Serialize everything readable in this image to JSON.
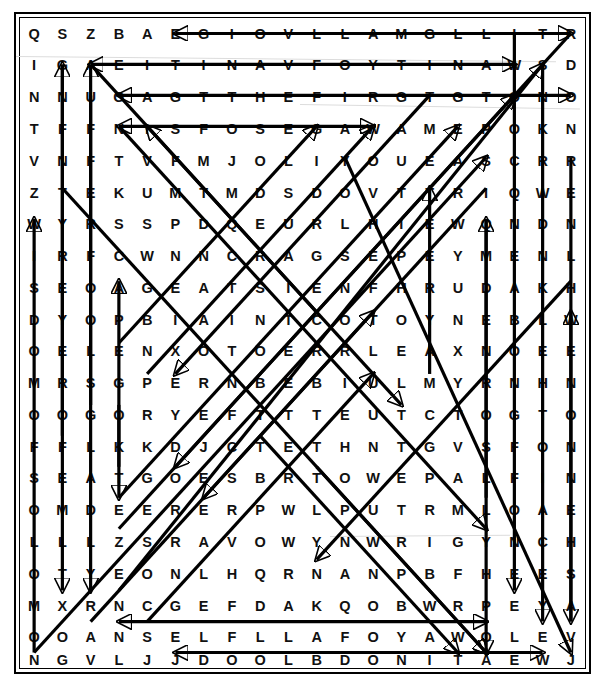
{
  "puzzle": {
    "type": "word-search",
    "rows": 20,
    "cols": 20,
    "ink_color": "#000000",
    "paper_color": "#ffffff",
    "grid": [
      [
        "Q",
        "S",
        "Z",
        "B",
        "A",
        "E",
        "G",
        "I",
        "O",
        "V",
        "L",
        "L",
        "A",
        "M",
        "G",
        "L",
        "L",
        "I",
        "T",
        "R"
      ],
      [
        "I",
        "G",
        "A",
        "E",
        "I",
        "T",
        "I",
        "N",
        "A",
        "V",
        "F",
        "O",
        "Y",
        "T",
        "I",
        "N",
        "A",
        "W",
        "S",
        "D"
      ],
      [
        "N",
        "N",
        "U",
        "G",
        "A",
        "G",
        "T",
        "T",
        "H",
        "E",
        "F",
        "I",
        "R",
        "G",
        "T",
        "G",
        "T",
        "O",
        "N",
        "O"
      ],
      [
        "T",
        "F",
        "F",
        "N",
        "I",
        "S",
        "F",
        "O",
        "S",
        "E",
        "G",
        "A",
        "W",
        "A",
        "M",
        "E",
        "P",
        "O",
        "K",
        "N",
        "C"
      ],
      [
        "V",
        "N",
        "F",
        "T",
        "V",
        "F",
        "M",
        "J",
        "O",
        "L",
        "I",
        "Y",
        "O",
        "U",
        "E",
        "A",
        "S",
        "C",
        "R",
        "R"
      ],
      [
        "Z",
        "T",
        "E",
        "K",
        "U",
        "M",
        "T",
        "M",
        "D",
        "S",
        "D",
        "O",
        "V",
        "T",
        "T",
        "R",
        "I",
        "Q",
        "W",
        "E"
      ],
      [
        "W",
        "Y",
        "R",
        "S",
        "S",
        "P",
        "D",
        "Q",
        "E",
        "U",
        "R",
        "L",
        "H",
        "I",
        "E",
        "W",
        "Q",
        "N",
        "D",
        "N"
      ],
      [
        "I",
        "R",
        "F",
        "C",
        "W",
        "N",
        "N",
        "C",
        "R",
        "A",
        "G",
        "S",
        "E",
        "P",
        "E",
        "Y",
        "M",
        "E",
        "N",
        "L"
      ],
      [
        "S",
        "E",
        "O",
        "A",
        "G",
        "E",
        "A",
        "T",
        "S",
        "I",
        "E",
        "N",
        "F",
        "H",
        "R",
        "U",
        "D",
        "A",
        "K",
        "H"
      ],
      [
        "D",
        "Y",
        "O",
        "P",
        "B",
        "I",
        "A",
        "I",
        "N",
        "T",
        "C",
        "O",
        "T",
        "O",
        "Y",
        "N",
        "E",
        "B",
        "L",
        "W"
      ],
      [
        "O",
        "E",
        "L",
        "E",
        "N",
        "X",
        "O",
        "T",
        "O",
        "E",
        "R",
        "R",
        "L",
        "E",
        "A",
        "X",
        "N",
        "O",
        "E",
        "E"
      ],
      [
        "M",
        "R",
        "S",
        "G",
        "P",
        "E",
        "R",
        "N",
        "B",
        "E",
        "B",
        "I",
        "U",
        "L",
        "M",
        "Y",
        "R",
        "N",
        "H",
        "N"
      ],
      [
        "O",
        "O",
        "G",
        "O",
        "R",
        "Y",
        "E",
        "F",
        "T",
        "T",
        "T",
        "E",
        "U",
        "T",
        "C",
        "T",
        "O",
        "G",
        "T",
        "O"
      ],
      [
        "F",
        "F",
        "L",
        "K",
        "K",
        "D",
        "J",
        "C",
        "T",
        "E",
        "T",
        "H",
        "N",
        "T",
        "G",
        "V",
        "S",
        "F",
        "O",
        "N"
      ],
      [
        "S",
        "E",
        "A",
        "T",
        "G",
        "O",
        "E",
        "S",
        "B",
        "R",
        "T",
        "O",
        "W",
        "E",
        "P",
        "A",
        "L",
        "F",
        "I",
        "N"
      ],
      [
        "O",
        "M",
        "D",
        "E",
        "E",
        "R",
        "E",
        "R",
        "P",
        "W",
        "L",
        "P",
        "U",
        "T",
        "R",
        "M",
        "L",
        "O",
        "A",
        "E"
      ],
      [
        "L",
        "L",
        "L",
        "Z",
        "S",
        "R",
        "A",
        "V",
        "O",
        "W",
        "Y",
        "N",
        "W",
        "R",
        "I",
        "G",
        "Y",
        "N",
        "C",
        "H"
      ],
      [
        "O",
        "T",
        "Y",
        "E",
        "O",
        "N",
        "L",
        "H",
        "Q",
        "R",
        "N",
        "A",
        "N",
        "P",
        "B",
        "F",
        "H",
        "E",
        "E",
        "S"
      ],
      [
        "M",
        "X",
        "R",
        "N",
        "C",
        "G",
        "E",
        "F",
        "D",
        "A",
        "K",
        "Q",
        "O",
        "B",
        "W",
        "R",
        "P",
        "E",
        "Y",
        "A"
      ],
      [
        "O",
        "O",
        "A",
        "N",
        "S",
        "E",
        "L",
        "F",
        "L",
        "L",
        "A",
        "F",
        "O",
        "Y",
        "A",
        "W",
        "O",
        "L",
        "E",
        "V"
      ],
      [
        "N",
        "G",
        "V",
        "L",
        "J",
        "J",
        "D",
        "O",
        "O",
        "L",
        "B",
        "D",
        "O",
        "N",
        "I",
        "T",
        "A",
        "E",
        "W",
        "J"
      ]
    ]
  },
  "solution_lines": [
    {
      "name": "row-0-horizontal-left-arrow",
      "from_cell": [
        0,
        19
      ],
      "to_cell": [
        0,
        5
      ],
      "arrow": "both"
    },
    {
      "name": "row-1-horizontal-right-arrow",
      "from_cell": [
        1,
        2
      ],
      "to_cell": [
        1,
        17
      ],
      "arrow": "both"
    },
    {
      "name": "row-2-horizontal-right-arrow",
      "from_cell": [
        2,
        3
      ],
      "to_cell": [
        2,
        19
      ],
      "arrow": "both"
    },
    {
      "name": "row-3-horizontal-right-arrow",
      "from_cell": [
        3,
        3
      ],
      "to_cell": [
        3,
        12
      ],
      "arrow": "both"
    },
    {
      "name": "row-19-horizontal-right-arrow",
      "from_cell": [
        19,
        3
      ],
      "to_cell": [
        19,
        16
      ],
      "arrow": "both"
    },
    {
      "name": "row-20-horizontal-right-arrow",
      "from_cell": [
        20,
        5
      ],
      "to_cell": [
        20,
        18
      ],
      "arrow": "both"
    },
    {
      "name": "col-1-vertical-up",
      "from_cell": [
        13,
        1
      ],
      "to_cell": [
        1,
        1
      ],
      "arrow": "end"
    },
    {
      "name": "col-2-vertical-up",
      "from_cell": [
        12,
        2
      ],
      "to_cell": [
        1,
        2
      ],
      "arrow": "end"
    },
    {
      "name": "col-1-vertical-down",
      "from_cell": [
        1,
        1
      ],
      "to_cell": [
        18,
        1
      ],
      "arrow": "end"
    },
    {
      "name": "col-2-vertical-down",
      "from_cell": [
        2,
        2
      ],
      "to_cell": [
        18,
        2
      ],
      "arrow": "end"
    },
    {
      "name": "col-0-vertical-up",
      "from_cell": [
        20,
        0
      ],
      "to_cell": [
        6,
        0
      ],
      "arrow": "end"
    },
    {
      "name": "col-3-vertical-up",
      "from_cell": [
        14,
        3
      ],
      "to_cell": [
        8,
        3
      ],
      "arrow": "end"
    },
    {
      "name": "col-3-vertical-down",
      "from_cell": [
        12,
        3
      ],
      "to_cell": [
        15,
        3
      ],
      "arrow": "end"
    },
    {
      "name": "col-14-vertical-up",
      "from_cell": [
        11,
        14
      ],
      "to_cell": [
        5,
        14
      ],
      "arrow": "end"
    },
    {
      "name": "col-16-vertical-up",
      "from_cell": [
        15,
        16
      ],
      "to_cell": [
        6,
        16
      ],
      "arrow": "end"
    },
    {
      "name": "col-16-vertical-down",
      "from_cell": [
        6,
        16
      ],
      "to_cell": [
        20,
        16
      ],
      "arrow": "end"
    },
    {
      "name": "col-17-vertical-down",
      "from_cell": [
        0,
        17
      ],
      "to_cell": [
        18,
        17
      ],
      "arrow": "end"
    },
    {
      "name": "col-18-vertical-down",
      "from_cell": [
        1,
        18
      ],
      "to_cell": [
        19,
        18
      ],
      "arrow": "end"
    },
    {
      "name": "col-19-vertical-down",
      "from_cell": [
        4,
        19
      ],
      "to_cell": [
        19,
        19
      ],
      "arrow": "end"
    },
    {
      "name": "col-19-vertical-up",
      "from_cell": [
        19,
        19
      ],
      "to_cell": [
        9,
        19
      ],
      "arrow": "end"
    },
    {
      "name": "diag-down-right-1",
      "from_cell": [
        1,
        2
      ],
      "to_cell": [
        12,
        13
      ],
      "arrow": "end"
    },
    {
      "name": "diag-down-right-2",
      "from_cell": [
        3,
        3
      ],
      "to_cell": [
        16,
        16
      ],
      "arrow": "end"
    },
    {
      "name": "diag-down-right-3",
      "from_cell": [
        5,
        1
      ],
      "to_cell": [
        20,
        16
      ],
      "arrow": "end"
    },
    {
      "name": "diag-up-right-1",
      "from_cell": [
        10,
        3
      ],
      "to_cell": [
        3,
        10
      ],
      "arrow": "end"
    },
    {
      "name": "diag-up-right-2",
      "from_cell": [
        11,
        4
      ],
      "to_cell": [
        3,
        12
      ],
      "arrow": "end"
    },
    {
      "name": "diag-up-right-3",
      "from_cell": [
        15,
        3
      ],
      "to_cell": [
        3,
        15
      ],
      "arrow": "end"
    },
    {
      "name": "diag-up-right-4",
      "from_cell": [
        16,
        3
      ],
      "to_cell": [
        2,
        17
      ],
      "arrow": "end"
    },
    {
      "name": "diag-up-right-5",
      "from_cell": [
        18,
        3
      ],
      "to_cell": [
        1,
        18
      ],
      "arrow": "end"
    },
    {
      "name": "diag-up-right-6",
      "from_cell": [
        19,
        2
      ],
      "to_cell": [
        9,
        12
      ],
      "arrow": "end"
    },
    {
      "name": "diag-up-right-7",
      "from_cell": [
        20,
        0
      ],
      "to_cell": [
        4,
        16
      ],
      "arrow": "end"
    },
    {
      "name": "diag-up-right-8",
      "from_cell": [
        19,
        4
      ],
      "to_cell": [
        11,
        12
      ],
      "arrow": "end"
    },
    {
      "name": "diag-up-left-1",
      "from_cell": [
        9,
        10
      ],
      "to_cell": [
        3,
        4
      ],
      "arrow": "end"
    },
    {
      "name": "diag-down-right-4",
      "from_cell": [
        4,
        11
      ],
      "to_cell": [
        20,
        19
      ],
      "arrow": "end"
    },
    {
      "name": "diag-down-right-5",
      "from_cell": [
        13,
        8
      ],
      "to_cell": [
        20,
        15
      ],
      "arrow": "end"
    },
    {
      "name": "diag-down-right-6",
      "from_cell": [
        14,
        10
      ],
      "to_cell": [
        20,
        16
      ],
      "arrow": "end"
    },
    {
      "name": "diag-down-left-1",
      "from_cell": [
        0,
        19
      ],
      "to_cell": [
        14,
        5
      ],
      "arrow": "end"
    },
    {
      "name": "diag-down-left-2",
      "from_cell": [
        2,
        14
      ],
      "to_cell": [
        11,
        5
      ],
      "arrow": "end"
    },
    {
      "name": "diag-down-left-3",
      "from_cell": [
        5,
        16
      ],
      "to_cell": [
        15,
        6
      ],
      "arrow": "end"
    },
    {
      "name": "diag-down-left-4",
      "from_cell": [
        8,
        19
      ],
      "to_cell": [
        17,
        10
      ],
      "arrow": "end"
    }
  ]
}
